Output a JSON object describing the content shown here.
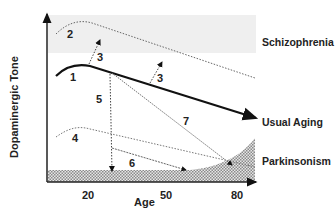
{
  "diagram": {
    "y_axis_label": "Dopaminergic Tone",
    "x_axis_label": "Age",
    "x_ticks": [
      "20",
      "50",
      "80"
    ],
    "regions": {
      "schizophrenia": "Schizophrenia",
      "usual_aging": "Usual Aging",
      "parkinsonism": "Parkinsonism"
    },
    "curve_labels": [
      "1",
      "2",
      "3",
      "3",
      "4",
      "5",
      "6",
      "7"
    ],
    "colors": {
      "axis": "#222222",
      "main_curve": "#111111",
      "dotted_curves": "#777777",
      "schizophrenia_band": "#ededed",
      "hatch": "#9a9a9a"
    }
  }
}
